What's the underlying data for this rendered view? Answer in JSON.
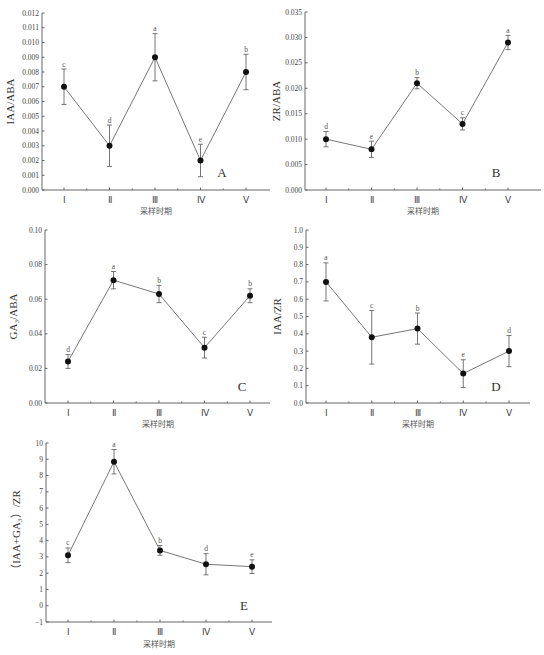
{
  "chart_data": [
    {
      "id": "A",
      "type": "line",
      "panel_label": "A",
      "xlabel": "采样时期",
      "ylabel": "IAA/ABA",
      "categories": [
        "Ⅰ",
        "Ⅱ",
        "Ⅲ",
        "Ⅳ",
        "Ⅴ"
      ],
      "values": [
        0.007,
        0.003,
        0.009,
        0.002,
        0.008
      ],
      "errors": [
        0.0012,
        0.0014,
        0.0016,
        0.0011,
        0.0012
      ],
      "significance": [
        "c",
        "d",
        "a",
        "e",
        "b"
      ],
      "ylim": [
        0,
        0.012
      ],
      "yticks": [
        0.0,
        0.001,
        0.002,
        0.003,
        0.004,
        0.005,
        0.006,
        0.007,
        0.008,
        0.009,
        0.01,
        0.011,
        0.012
      ],
      "ytick_labels": [
        "0.000",
        "0.001",
        "0.002",
        "0.003",
        "0.004",
        "0.005",
        "0.006",
        "0.007",
        "0.008",
        "0.009",
        "0.010",
        "0.011",
        "0.012"
      ],
      "grid": false
    },
    {
      "id": "B",
      "type": "line",
      "panel_label": "B",
      "xlabel": "采样时期",
      "ylabel": "ZR/ABA",
      "categories": [
        "Ⅰ",
        "Ⅱ",
        "Ⅲ",
        "Ⅳ",
        "Ⅴ"
      ],
      "values": [
        0.01,
        0.008,
        0.021,
        0.013,
        0.029
      ],
      "errors": [
        0.0015,
        0.0016,
        0.0011,
        0.0012,
        0.0014
      ],
      "significance": [
        "d",
        "e",
        "b",
        "c",
        "a"
      ],
      "ylim": [
        0,
        0.035
      ],
      "yticks": [
        0,
        0.005,
        0.01,
        0.015,
        0.02,
        0.025,
        0.03,
        0.035
      ],
      "ytick_labels": [
        "0.000",
        "0.005",
        "0.010",
        "0.015",
        "0.020",
        "0.025",
        "0.030",
        "0.035"
      ],
      "grid": false
    },
    {
      "id": "C",
      "type": "line",
      "panel_label": "C",
      "xlabel": "采样时期",
      "ylabel": "GA₃/ABA",
      "categories": [
        "Ⅰ",
        "Ⅱ",
        "Ⅲ",
        "Ⅳ",
        "Ⅴ"
      ],
      "values": [
        0.024,
        0.071,
        0.063,
        0.032,
        0.062
      ],
      "errors": [
        0.004,
        0.005,
        0.005,
        0.006,
        0.004
      ],
      "significance": [
        "d",
        "a",
        "b",
        "c",
        "b"
      ],
      "ylim": [
        0,
        0.1
      ],
      "yticks": [
        0,
        0.02,
        0.04,
        0.06,
        0.08,
        0.1
      ],
      "ytick_labels": [
        "0.00",
        "0.02",
        "0.04",
        "0.06",
        "0.08",
        "0.10"
      ],
      "grid": false
    },
    {
      "id": "D",
      "type": "line",
      "panel_label": "D",
      "xlabel": "采样时期",
      "ylabel": "IAA/ZR",
      "categories": [
        "Ⅰ",
        "Ⅱ",
        "Ⅲ",
        "Ⅳ",
        "Ⅴ"
      ],
      "values": [
        0.7,
        0.38,
        0.43,
        0.17,
        0.3
      ],
      "errors": [
        0.11,
        0.155,
        0.09,
        0.08,
        0.09
      ],
      "significance": [
        "a",
        "c",
        "b",
        "e",
        "d"
      ],
      "ylim": [
        0,
        1.0
      ],
      "yticks": [
        0,
        0.1,
        0.2,
        0.3,
        0.4,
        0.5,
        0.6,
        0.7,
        0.8,
        0.9,
        1.0
      ],
      "ytick_labels": [
        "0.0",
        "0.1",
        "0.2",
        "0.3",
        "0.4",
        "0.5",
        "0.6",
        "0.7",
        "0.8",
        "0.9",
        "1.0"
      ],
      "grid": false
    },
    {
      "id": "E",
      "type": "line",
      "panel_label": "E",
      "xlabel": "采样时期",
      "ylabel": "（IAA+GA₃）/ZR",
      "categories": [
        "Ⅰ",
        "Ⅱ",
        "Ⅲ",
        "Ⅳ",
        "Ⅴ"
      ],
      "values": [
        3.1,
        8.85,
        3.4,
        2.55,
        2.4
      ],
      "errors": [
        0.45,
        0.75,
        0.3,
        0.65,
        0.42
      ],
      "significance": [
        "c",
        "a",
        "b",
        "d",
        "e"
      ],
      "ylim": [
        -1,
        10
      ],
      "yticks": [
        -1,
        0,
        1,
        2,
        3,
        4,
        5,
        6,
        7,
        8,
        9,
        10
      ],
      "ytick_labels": [
        "−1",
        "0",
        "1",
        "2",
        "3",
        "4",
        "5",
        "6",
        "7",
        "8",
        "9",
        "10"
      ],
      "grid": false
    }
  ]
}
